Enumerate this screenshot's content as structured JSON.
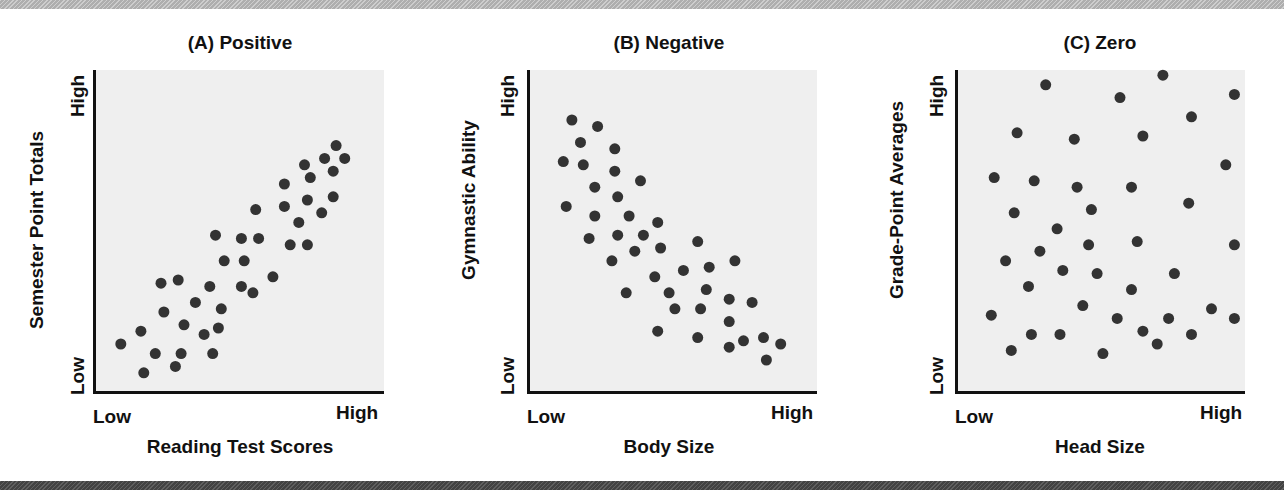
{
  "style": {
    "plot_bg": "#efefef",
    "dot_color": "#333333",
    "axis_color": "#111111",
    "top_band": "#bdbdbd",
    "bottom_band": "#4e4e4e"
  },
  "chart_data": [
    {
      "type": "scatter",
      "title": "(A) Positive",
      "xlabel": "Reading Test Scores",
      "ylabel": "Semester Point Totals",
      "x_tick_labels": [
        "Low",
        "High"
      ],
      "y_tick_labels": [
        "Low",
        "High"
      ],
      "xlim": [
        0,
        100
      ],
      "ylim": [
        0,
        100
      ],
      "grid": false,
      "points": [
        [
          9,
          15
        ],
        [
          16,
          19
        ],
        [
          17,
          6
        ],
        [
          21,
          12
        ],
        [
          23,
          34
        ],
        [
          24,
          25
        ],
        [
          28,
          8
        ],
        [
          29,
          35
        ],
        [
          30,
          12
        ],
        [
          31,
          21
        ],
        [
          35,
          28
        ],
        [
          38,
          18
        ],
        [
          40,
          33
        ],
        [
          41,
          12
        ],
        [
          42,
          49
        ],
        [
          43,
          20
        ],
        [
          44,
          26
        ],
        [
          45,
          41
        ],
        [
          51,
          33
        ],
        [
          51,
          48
        ],
        [
          52,
          41
        ],
        [
          55,
          31
        ],
        [
          56,
          57
        ],
        [
          57,
          48
        ],
        [
          62,
          36
        ],
        [
          66,
          65
        ],
        [
          66,
          58
        ],
        [
          68,
          46
        ],
        [
          71,
          53
        ],
        [
          73,
          71
        ],
        [
          74,
          60
        ],
        [
          74,
          46
        ],
        [
          75,
          67
        ],
        [
          79,
          56
        ],
        [
          80,
          73
        ],
        [
          83,
          61
        ],
        [
          83,
          69
        ],
        [
          84,
          77
        ],
        [
          87,
          73
        ]
      ]
    },
    {
      "type": "scatter",
      "title": "(B) Negative",
      "xlabel": "Body Size",
      "ylabel": "Gymnastic Ability",
      "x_tick_labels": [
        "Low",
        "High"
      ],
      "y_tick_labels": [
        "Low",
        "High"
      ],
      "xlim": [
        0,
        100
      ],
      "ylim": [
        0,
        100
      ],
      "grid": false,
      "points": [
        [
          15,
          85
        ],
        [
          24,
          83
        ],
        [
          18,
          78
        ],
        [
          30,
          76
        ],
        [
          12,
          72
        ],
        [
          19,
          71
        ],
        [
          30,
          69
        ],
        [
          39,
          66
        ],
        [
          23,
          64
        ],
        [
          31,
          61
        ],
        [
          13,
          58
        ],
        [
          23,
          55
        ],
        [
          35,
          55
        ],
        [
          45,
          53
        ],
        [
          21,
          48
        ],
        [
          31,
          49
        ],
        [
          40,
          49
        ],
        [
          59,
          47
        ],
        [
          37,
          44
        ],
        [
          46,
          45
        ],
        [
          29,
          41
        ],
        [
          72,
          41
        ],
        [
          44,
          36
        ],
        [
          54,
          38
        ],
        [
          63,
          39
        ],
        [
          34,
          31
        ],
        [
          49,
          31
        ],
        [
          62,
          32
        ],
        [
          70,
          29
        ],
        [
          78,
          28
        ],
        [
          51,
          26
        ],
        [
          60,
          26
        ],
        [
          70,
          22
        ],
        [
          45,
          19
        ],
        [
          59,
          17
        ],
        [
          75,
          16
        ],
        [
          82,
          17
        ],
        [
          88,
          15
        ],
        [
          70,
          14
        ],
        [
          83,
          10
        ]
      ]
    },
    {
      "type": "scatter",
      "title": "(C) Zero",
      "xlabel": "Head Size",
      "ylabel": "Grade-Point Averages",
      "x_tick_labels": [
        "Low",
        "High"
      ],
      "y_tick_labels": [
        "Low",
        "High"
      ],
      "xlim": [
        0,
        100
      ],
      "ylim": [
        0,
        100
      ],
      "grid": false,
      "points": [
        [
          31,
          96
        ],
        [
          72,
          99
        ],
        [
          57,
          92
        ],
        [
          97,
          93
        ],
        [
          82,
          86
        ],
        [
          21,
          81
        ],
        [
          41,
          79
        ],
        [
          65,
          80
        ],
        [
          94,
          71
        ],
        [
          13,
          67
        ],
        [
          27,
          66
        ],
        [
          42,
          64
        ],
        [
          61,
          64
        ],
        [
          81,
          59
        ],
        [
          20,
          56
        ],
        [
          47,
          57
        ],
        [
          35,
          51
        ],
        [
          63,
          47
        ],
        [
          97,
          46
        ],
        [
          46,
          46
        ],
        [
          29,
          44
        ],
        [
          17,
          41
        ],
        [
          37,
          38
        ],
        [
          49,
          37
        ],
        [
          76,
          37
        ],
        [
          25,
          33
        ],
        [
          61,
          32
        ],
        [
          44,
          27
        ],
        [
          89,
          26
        ],
        [
          12,
          24
        ],
        [
          56,
          23
        ],
        [
          74,
          23
        ],
        [
          97,
          23
        ],
        [
          65,
          19
        ],
        [
          26,
          18
        ],
        [
          36,
          18
        ],
        [
          82,
          18
        ],
        [
          70,
          15
        ],
        [
          19,
          13
        ],
        [
          51,
          12
        ]
      ]
    }
  ]
}
